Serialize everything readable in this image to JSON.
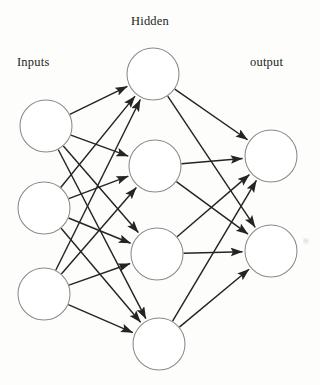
{
  "diagram": {
    "background_color": "#fdfdfb",
    "node_stroke_color": "#8c8a88",
    "node_fill_color": "#ffffff",
    "edge_color": "#262423",
    "text_color": "#211f1e",
    "labels": {
      "inputs": "Inputs",
      "hidden": "Hidden",
      "output": "output"
    },
    "layers": [
      {
        "name": "inputs",
        "label": "Inputs",
        "node_count": 3,
        "radius": 26,
        "nodes": [
          {
            "id": "i1",
            "cx": 46,
            "cy": 126
          },
          {
            "id": "i2",
            "cx": 44,
            "cy": 208
          },
          {
            "id": "i3",
            "cx": 44,
            "cy": 294
          }
        ]
      },
      {
        "name": "hidden",
        "label": "Hidden",
        "node_count": 4,
        "radius": 26,
        "nodes": [
          {
            "id": "h1",
            "cx": 153,
            "cy": 74
          },
          {
            "id": "h2",
            "cx": 155,
            "cy": 166
          },
          {
            "id": "h3",
            "cx": 157,
            "cy": 254
          },
          {
            "id": "h4",
            "cx": 159,
            "cy": 344
          }
        ]
      },
      {
        "name": "output",
        "label": "output",
        "node_count": 2,
        "radius": 26,
        "nodes": [
          {
            "id": "o1",
            "cx": 271,
            "cy": 156
          },
          {
            "id": "o2",
            "cx": 271,
            "cy": 251
          }
        ]
      }
    ],
    "connections": {
      "style": "fully-connected",
      "arrowhead": "filled-triangle",
      "input_to_hidden": [
        {
          "from": "i1",
          "to": "h1"
        },
        {
          "from": "i1",
          "to": "h2"
        },
        {
          "from": "i1",
          "to": "h3"
        },
        {
          "from": "i1",
          "to": "h4"
        },
        {
          "from": "i2",
          "to": "h1"
        },
        {
          "from": "i2",
          "to": "h2"
        },
        {
          "from": "i2",
          "to": "h3"
        },
        {
          "from": "i2",
          "to": "h4"
        },
        {
          "from": "i3",
          "to": "h1"
        },
        {
          "from": "i3",
          "to": "h2"
        },
        {
          "from": "i3",
          "to": "h3"
        },
        {
          "from": "i3",
          "to": "h4"
        }
      ],
      "hidden_to_output": [
        {
          "from": "h1",
          "to": "o1"
        },
        {
          "from": "h1",
          "to": "o2"
        },
        {
          "from": "h2",
          "to": "o1"
        },
        {
          "from": "h2",
          "to": "o2"
        },
        {
          "from": "h3",
          "to": "o1"
        },
        {
          "from": "h3",
          "to": "o2"
        },
        {
          "from": "h4",
          "to": "o1"
        },
        {
          "from": "h4",
          "to": "o2"
        }
      ]
    }
  }
}
